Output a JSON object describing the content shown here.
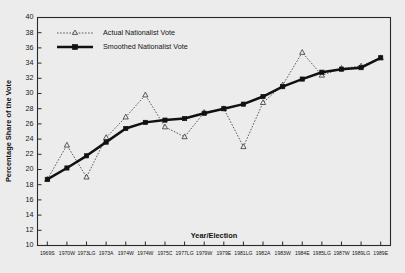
{
  "chart_data": {
    "type": "line",
    "title": "",
    "xlabel": "Year/Election",
    "ylabel": "Percentage Share of the Vote",
    "ylim": [
      10,
      40
    ],
    "ytick_step": 2,
    "yticks": [
      10,
      12,
      14,
      16,
      18,
      20,
      22,
      24,
      26,
      28,
      30,
      32,
      34,
      36,
      38,
      40
    ],
    "grid": false,
    "legend_position": "top-left",
    "categories": [
      "1969S",
      "1970W",
      "1973LG",
      "1973A",
      "1974W",
      "1974W",
      "1975C",
      "1977LG",
      "1979W",
      "1979E",
      "1981LG",
      "1982A",
      "1983W",
      "1984E",
      "1985LG",
      "1987W",
      "1989LG",
      "1989E"
    ],
    "series": [
      {
        "name": "Actual Nationalist Vote",
        "marker": "triangle",
        "style": "dotted",
        "values": [
          18.7,
          23.2,
          19.0,
          24.2,
          26.9,
          29.8,
          25.6,
          24.3,
          27.5,
          28.0,
          23.0,
          28.8,
          31.1,
          35.4,
          32.4,
          33.3,
          33.6,
          34.7
        ]
      },
      {
        "name": "Smoothed Nationalist Vote",
        "marker": "square",
        "style": "solid-thick",
        "values": [
          18.7,
          20.2,
          21.8,
          23.6,
          25.4,
          26.2,
          26.5,
          26.7,
          27.4,
          28.0,
          28.6,
          29.6,
          30.9,
          31.9,
          32.8,
          33.2,
          33.4,
          34.7
        ]
      }
    ]
  },
  "legend": {
    "items": [
      {
        "label": "Actual Nationalist Vote"
      },
      {
        "label": "Smoothed Nationalist Vote"
      }
    ]
  }
}
